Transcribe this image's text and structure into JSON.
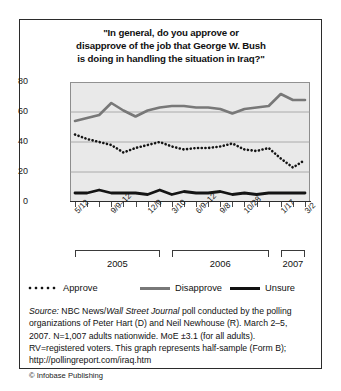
{
  "figure": {
    "title_lines": [
      "\"In general, do you approve or",
      "disapprove of the job that George W. Bush",
      "is doing in handling the situation in Iraq?\""
    ],
    "copyright": "© Infobase Publishing"
  },
  "source": {
    "label": "Source:",
    "text_1": " NBC News/",
    "italic_1": "Wall Street Journal",
    "text_2": " poll conducted by the polling organizations of Peter Hart (D) and Neil Newhouse (R). March 2–5, 2007. N=1,007 adults nationwide. MoE ±3.1 (for all adults). RV=registered voters. This graph represents half-sample (Form B); http://pollingreport.com/iraq.htm"
  },
  "year_brackets": [
    {
      "label": "2005",
      "start_index": 0,
      "end_index": 7
    },
    {
      "label": "2006",
      "start_index": 8,
      "end_index": 16
    },
    {
      "label": "2007",
      "start_index": 17,
      "end_index": 19
    }
  ],
  "colors": {
    "approve": "#141414",
    "disapprove": "#787878",
    "unsure": "#141414",
    "plot_background": "#e9e9e9",
    "gridline": "#9a9a9a",
    "axis": "#2b2b2b",
    "frame": "#2b2b2b"
  },
  "chart_data": {
    "type": "line",
    "title": "\"In general, do you approve or disapprove of the job that George W. Bush is doing in handling the situation in Iraq?\"",
    "xlabel": "",
    "ylabel": "Percentage of Respondees",
    "ylim": [
      0,
      80
    ],
    "yticks": [
      0,
      20,
      40,
      60,
      80
    ],
    "grid": true,
    "legend_position": "bottom",
    "x": [
      "5/12",
      "6/9",
      "7/8",
      "9/9–12",
      "10/8",
      "11/4",
      "12/9",
      "1/20",
      "3/10",
      "4/21",
      "6/9–12",
      "7/21",
      "9/8",
      "10/6",
      "10/28",
      "11/17",
      "12/8",
      "1/17",
      "2/10",
      "3/2"
    ],
    "xtick_labels_shown": [
      "5/12",
      "9/9–12",
      "12/9",
      "3/10",
      "6/9–12",
      "9/8",
      "10/28",
      "1/17",
      "3/2"
    ],
    "series": [
      {
        "name": "Approve",
        "style": "dotted",
        "color": "#141414",
        "values": [
          45,
          42,
          40,
          38,
          33,
          36,
          38,
          40,
          37,
          35,
          36,
          36,
          37,
          39,
          35,
          34,
          36,
          29,
          23,
          28
        ]
      },
      {
        "name": "Disapprove",
        "style": "solid-gray",
        "color": "#787878",
        "values": [
          54,
          56,
          58,
          66,
          61,
          57,
          61,
          63,
          64,
          64,
          63,
          63,
          62,
          59,
          62,
          63,
          64,
          72,
          68,
          68
        ]
      },
      {
        "name": "Unsure",
        "style": "solid-black",
        "color": "#141414",
        "values": [
          6,
          6,
          8,
          6,
          6,
          6,
          5,
          8,
          5,
          7,
          6,
          6,
          7,
          5,
          6,
          5,
          6,
          6,
          6,
          6
        ]
      }
    ]
  }
}
